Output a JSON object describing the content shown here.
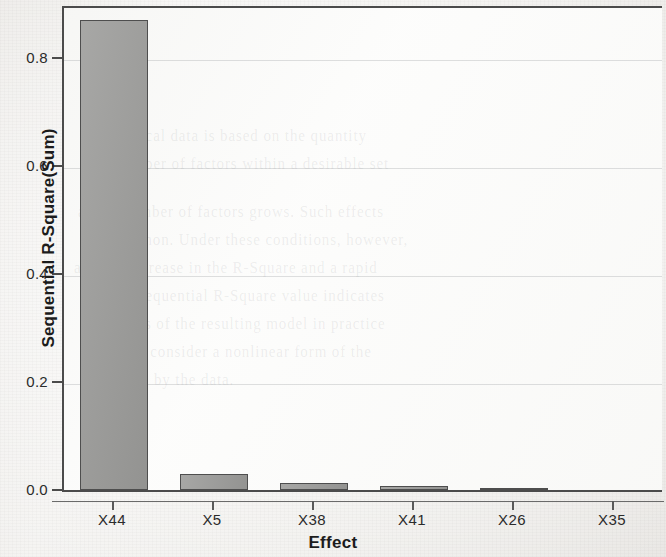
{
  "chart_data": {
    "type": "bar",
    "title": "",
    "subtitle": "",
    "xlabel": "Effect",
    "ylabel": "Sequential R-Square(Sum)",
    "categories": [
      "X44",
      "X5",
      "X38",
      "X41",
      "X26",
      "X35"
    ],
    "values": [
      0.883,
      0.031,
      0.013,
      0.007,
      0.001,
      0.0
    ],
    "series": [
      {
        "name": "Sequential R-Square(Sum)",
        "values": [
          0.883,
          0.031,
          0.013,
          0.007,
          0.001,
          0.0
        ]
      }
    ],
    "ylim": [
      0.0,
      0.91
    ],
    "y_ticks": [
      "0.0",
      "0.2",
      "0.4",
      "0.6",
      "0.8"
    ],
    "y_tick_values": [
      0.0,
      0.2,
      0.4,
      0.6,
      0.8
    ],
    "x_ticks": [
      "X44",
      "X5",
      "X38",
      "X41",
      "X26",
      "X35"
    ],
    "grid": "horizontal-faint",
    "legend": "none",
    "legend_position": "none",
    "annotations": [],
    "colors": {
      "bar_fill": "#9b9b99",
      "bar_border": "#4e4e4e",
      "axis": "#4b4b4b",
      "text": "#1c1c1c",
      "plot_background": "#fcfcfb",
      "figure_background": "#f0efec",
      "gridline": "#969a9c"
    }
  },
  "axes": {
    "y_title": "Sequential R-Square(Sum)",
    "x_title": "Effect",
    "y_tick_labels": [
      "0.8",
      "0.6",
      "0.4",
      "0.2",
      "0.0"
    ],
    "x_tick_labels": [
      "X44",
      "X5",
      "X38",
      "X41",
      "X26",
      "X35"
    ]
  },
  "scan_artifacts": {
    "bleed_text": [
      "of historical data is based on the quantity",
      "the number of factors within a desirable set",
      "as the number of factors grows. Such effects",
      "are common. Under these conditions, however,",
      "a sharp increase in the R-Square and a rapid",
      "and the sequential R-Square value indicates",
      "the effects of the resulting model in practice",
      "one may consider a nonlinear form of the",
      "supported by the data."
    ]
  }
}
